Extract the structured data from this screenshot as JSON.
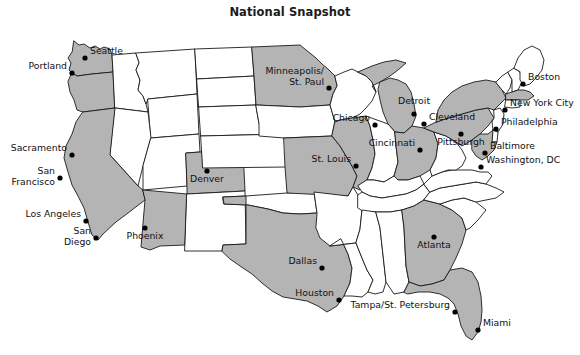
{
  "figure": {
    "title": "National Snapshot",
    "kind": "choropleth-map",
    "region": "United States",
    "background_color": "#ffffff",
    "shaded_fill_color": "#b4b4b4",
    "plain_fill_color": "#ffffff",
    "outline_color": "#1a1a1a",
    "marker_color": "#000000"
  },
  "cities": [
    {
      "name": "Seattle",
      "label": "Seattle",
      "anchor": "right",
      "dot_x": 85,
      "dot_y": 58,
      "label_x": 90,
      "label_y": 52
    },
    {
      "name": "Portland",
      "label": "Portland",
      "anchor": "left",
      "dot_x": 72,
      "dot_y": 73,
      "label_x": 67,
      "label_y": 67
    },
    {
      "name": "Sacramento",
      "label": "Sacramento",
      "anchor": "left",
      "dot_x": 72,
      "dot_y": 155,
      "label_x": 66,
      "label_y": 149
    },
    {
      "name": "San Francisco",
      "label": "San\nFrancisco",
      "anchor": "left",
      "dot_x": 60,
      "dot_y": 178,
      "label_x": 54,
      "label_y": 172
    },
    {
      "name": "Los Angeles",
      "label": "Los Angeles",
      "anchor": "left",
      "dot_x": 86,
      "dot_y": 221,
      "label_x": 80,
      "label_y": 215
    },
    {
      "name": "San Diego",
      "label": "San\nDiego",
      "anchor": "left",
      "dot_x": 96,
      "dot_y": 238,
      "label_x": 90,
      "label_y": 232
    },
    {
      "name": "Phoenix",
      "label": "Phoenix",
      "anchor": "center",
      "dot_x": 145,
      "dot_y": 228,
      "label_x": 145,
      "label_y": 232
    },
    {
      "name": "Denver",
      "label": "Denver",
      "anchor": "center",
      "dot_x": 207,
      "dot_y": 171,
      "label_x": 207,
      "label_y": 175
    },
    {
      "name": "Minneapolis/St. Paul",
      "label": "Minneapolis/\nSt. Paul",
      "anchor": "left",
      "dot_x": 329,
      "dot_y": 88,
      "label_x": 324,
      "label_y": 70
    },
    {
      "name": "Chicago",
      "label": "Chicago",
      "anchor": "left",
      "dot_x": 375,
      "dot_y": 125,
      "label_x": 370,
      "label_y": 119
    },
    {
      "name": "St. Louis",
      "label": "St. Louis",
      "anchor": "left",
      "dot_x": 356,
      "dot_y": 166,
      "label_x": 351,
      "label_y": 160
    },
    {
      "name": "Detroit",
      "label": "Detroit",
      "anchor": "center",
      "dot_x": 414,
      "dot_y": 114,
      "label_x": 414,
      "label_y": 99
    },
    {
      "name": "Cleveland",
      "label": "Cleveland",
      "anchor": "right",
      "dot_x": 424,
      "dot_y": 124,
      "label_x": 429,
      "label_y": 118
    },
    {
      "name": "Cincinnati",
      "label": "Cincinnati",
      "anchor": "left",
      "dot_x": 420,
      "dot_y": 150,
      "label_x": 415,
      "label_y": 144
    },
    {
      "name": "Pittsburgh",
      "label": "Pittsburgh",
      "anchor": "center",
      "dot_x": 461,
      "dot_y": 134,
      "label_x": 461,
      "label_y": 138
    },
    {
      "name": "Boston",
      "label": "Boston",
      "anchor": "right",
      "dot_x": 523,
      "dot_y": 84,
      "label_x": 528,
      "label_y": 78
    },
    {
      "name": "New York City",
      "label": "New York City",
      "anchor": "right",
      "dot_x": 505,
      "dot_y": 110,
      "label_x": 510,
      "label_y": 104
    },
    {
      "name": "Philadelphia",
      "label": "Philadelphia",
      "anchor": "right",
      "dot_x": 496,
      "dot_y": 129,
      "label_x": 501,
      "label_y": 123
    },
    {
      "name": "Baltimore",
      "label": "Baltimore",
      "anchor": "right",
      "dot_x": 485,
      "dot_y": 153,
      "label_x": 490,
      "label_y": 147
    },
    {
      "name": "Washington, DC",
      "label": "Washington, DC",
      "anchor": "right",
      "dot_x": 481,
      "dot_y": 167,
      "label_x": 486,
      "label_y": 161
    },
    {
      "name": "Atlanta",
      "label": "Atlanta",
      "anchor": "center",
      "dot_x": 434,
      "dot_y": 237,
      "label_x": 434,
      "label_y": 241
    },
    {
      "name": "Dallas",
      "label": "Dallas",
      "anchor": "left",
      "dot_x": 322,
      "dot_y": 268,
      "label_x": 317,
      "label_y": 262
    },
    {
      "name": "Houston",
      "label": "Houston",
      "anchor": "left",
      "dot_x": 339,
      "dot_y": 300,
      "label_x": 334,
      "label_y": 294
    },
    {
      "name": "Tampa/St. Petersburg",
      "label": "Tampa/St. Petersburg",
      "anchor": "left",
      "dot_x": 455,
      "dot_y": 312,
      "label_x": 450,
      "label_y": 306
    },
    {
      "name": "Miami",
      "label": "Miami",
      "anchor": "right",
      "dot_x": 478,
      "dot_y": 330,
      "label_x": 483,
      "label_y": 324
    }
  ],
  "shaded_states": [
    "Washington",
    "Oregon",
    "California",
    "Arizona",
    "Colorado",
    "Texas",
    "Minnesota",
    "Missouri",
    "Illinois",
    "Michigan",
    "Ohio",
    "Pennsylvania",
    "New York",
    "Massachusetts",
    "Maryland",
    "Georgia",
    "Florida"
  ]
}
